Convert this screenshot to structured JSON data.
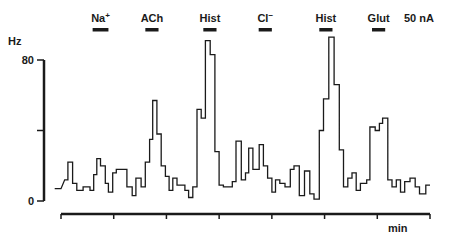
{
  "chart_data": {
    "type": "line",
    "subtype": "step",
    "title": "",
    "xlabel": "min",
    "ylabel": "Hz",
    "ylim": [
      0,
      80
    ],
    "y_ticks": [
      {
        "value": 0,
        "label": "0"
      },
      {
        "value": 40,
        "label": ""
      },
      {
        "value": 80,
        "label": "80"
      }
    ],
    "x_ticks_count": 8,
    "x_range_minutes": [
      0,
      7
    ],
    "grid": false,
    "scale_label": "50 nA",
    "drug_applications": [
      {
        "label": "Na+",
        "label_main": "Na",
        "label_sup": "+",
        "x_start_min": 0.6,
        "x_end_min": 0.9
      },
      {
        "label": "ACh",
        "label_main": "ACh",
        "label_sup": "",
        "x_start_min": 1.6,
        "x_end_min": 1.85
      },
      {
        "label": "Hist",
        "label_main": "Hist",
        "label_sup": "",
        "x_start_min": 2.7,
        "x_end_min": 2.95
      },
      {
        "label": "Cl−",
        "label_main": "Cl",
        "label_sup": "−",
        "x_start_min": 3.75,
        "x_end_min": 4.0
      },
      {
        "label": "Hist",
        "label_main": "Hist",
        "label_sup": "",
        "x_start_min": 4.9,
        "x_end_min": 5.15
      },
      {
        "label": "Glut",
        "label_main": "Glut",
        "label_sup": "",
        "x_start_min": 5.9,
        "x_end_min": 6.15
      }
    ],
    "series": [
      {
        "name": "Firing rate",
        "step_points": [
          [
            -0.12,
            7
          ],
          [
            0.0,
            7
          ],
          [
            0.07,
            12
          ],
          [
            0.13,
            12
          ],
          [
            0.13,
            22
          ],
          [
            0.22,
            22
          ],
          [
            0.22,
            10
          ],
          [
            0.3,
            10
          ],
          [
            0.3,
            6
          ],
          [
            0.42,
            6
          ],
          [
            0.42,
            8
          ],
          [
            0.55,
            8
          ],
          [
            0.55,
            6
          ],
          [
            0.62,
            6
          ],
          [
            0.62,
            15
          ],
          [
            0.68,
            15
          ],
          [
            0.68,
            24
          ],
          [
            0.75,
            24
          ],
          [
            0.75,
            20
          ],
          [
            0.84,
            20
          ],
          [
            0.84,
            10
          ],
          [
            0.9,
            10
          ],
          [
            0.9,
            5
          ],
          [
            0.98,
            5
          ],
          [
            0.98,
            16
          ],
          [
            1.05,
            16
          ],
          [
            1.05,
            18
          ],
          [
            1.25,
            18
          ],
          [
            1.25,
            8
          ],
          [
            1.35,
            8
          ],
          [
            1.35,
            3
          ],
          [
            1.42,
            3
          ],
          [
            1.42,
            13
          ],
          [
            1.52,
            13
          ],
          [
            1.52,
            8
          ],
          [
            1.6,
            8
          ],
          [
            1.6,
            22
          ],
          [
            1.68,
            22
          ],
          [
            1.68,
            35
          ],
          [
            1.74,
            35
          ],
          [
            1.74,
            57
          ],
          [
            1.82,
            57
          ],
          [
            1.82,
            38
          ],
          [
            1.9,
            38
          ],
          [
            1.9,
            20
          ],
          [
            1.98,
            20
          ],
          [
            1.98,
            14
          ],
          [
            2.05,
            14
          ],
          [
            2.05,
            6
          ],
          [
            2.12,
            6
          ],
          [
            2.12,
            13
          ],
          [
            2.2,
            13
          ],
          [
            2.2,
            9
          ],
          [
            2.35,
            9
          ],
          [
            2.35,
            6
          ],
          [
            2.42,
            6
          ],
          [
            2.42,
            2
          ],
          [
            2.5,
            2
          ],
          [
            2.5,
            8
          ],
          [
            2.58,
            8
          ],
          [
            2.58,
            52
          ],
          [
            2.66,
            52
          ],
          [
            2.66,
            47
          ],
          [
            2.74,
            47
          ],
          [
            2.74,
            91
          ],
          [
            2.83,
            91
          ],
          [
            2.83,
            83
          ],
          [
            2.92,
            83
          ],
          [
            2.92,
            28
          ],
          [
            3.0,
            28
          ],
          [
            3.0,
            9
          ],
          [
            3.08,
            9
          ],
          [
            3.08,
            8
          ],
          [
            3.25,
            8
          ],
          [
            3.25,
            11
          ],
          [
            3.32,
            11
          ],
          [
            3.32,
            34
          ],
          [
            3.42,
            34
          ],
          [
            3.42,
            12
          ],
          [
            3.5,
            12
          ],
          [
            3.5,
            16
          ],
          [
            3.56,
            16
          ],
          [
            3.56,
            30
          ],
          [
            3.64,
            30
          ],
          [
            3.64,
            18
          ],
          [
            3.76,
            18
          ],
          [
            3.76,
            32
          ],
          [
            3.84,
            32
          ],
          [
            3.84,
            20
          ],
          [
            3.92,
            20
          ],
          [
            3.92,
            13
          ],
          [
            4.0,
            13
          ],
          [
            4.0,
            5
          ],
          [
            4.07,
            5
          ],
          [
            4.07,
            12
          ],
          [
            4.15,
            12
          ],
          [
            4.15,
            10
          ],
          [
            4.25,
            10
          ],
          [
            4.25,
            8
          ],
          [
            4.35,
            8
          ],
          [
            4.35,
            18
          ],
          [
            4.42,
            18
          ],
          [
            4.42,
            20
          ],
          [
            4.52,
            20
          ],
          [
            4.52,
            3
          ],
          [
            4.62,
            3
          ],
          [
            4.62,
            17
          ],
          [
            4.72,
            17
          ],
          [
            4.72,
            4
          ],
          [
            4.8,
            4
          ],
          [
            4.8,
            1
          ],
          [
            4.9,
            1
          ],
          [
            4.9,
            40
          ],
          [
            4.98,
            40
          ],
          [
            4.98,
            58
          ],
          [
            5.08,
            58
          ],
          [
            5.08,
            93
          ],
          [
            5.18,
            93
          ],
          [
            5.18,
            66
          ],
          [
            5.28,
            66
          ],
          [
            5.28,
            29
          ],
          [
            5.36,
            29
          ],
          [
            5.36,
            8
          ],
          [
            5.44,
            8
          ],
          [
            5.44,
            13
          ],
          [
            5.52,
            13
          ],
          [
            5.52,
            16
          ],
          [
            5.6,
            16
          ],
          [
            5.6,
            6
          ],
          [
            5.68,
            6
          ],
          [
            5.68,
            10
          ],
          [
            5.8,
            10
          ],
          [
            5.8,
            12
          ],
          [
            5.86,
            12
          ],
          [
            5.86,
            42
          ],
          [
            5.96,
            42
          ],
          [
            5.96,
            40
          ],
          [
            6.04,
            40
          ],
          [
            6.04,
            44
          ],
          [
            6.1,
            44
          ],
          [
            6.1,
            47
          ],
          [
            6.2,
            47
          ],
          [
            6.2,
            12
          ],
          [
            6.28,
            12
          ],
          [
            6.28,
            8
          ],
          [
            6.36,
            8
          ],
          [
            6.36,
            12
          ],
          [
            6.44,
            12
          ],
          [
            6.44,
            5
          ],
          [
            6.52,
            5
          ],
          [
            6.52,
            11
          ],
          [
            6.62,
            11
          ],
          [
            6.62,
            13
          ],
          [
            6.72,
            13
          ],
          [
            6.72,
            8
          ],
          [
            6.8,
            8
          ],
          [
            6.8,
            4
          ],
          [
            6.92,
            4
          ],
          [
            6.92,
            9
          ],
          [
            7.0,
            9
          ]
        ]
      }
    ]
  }
}
